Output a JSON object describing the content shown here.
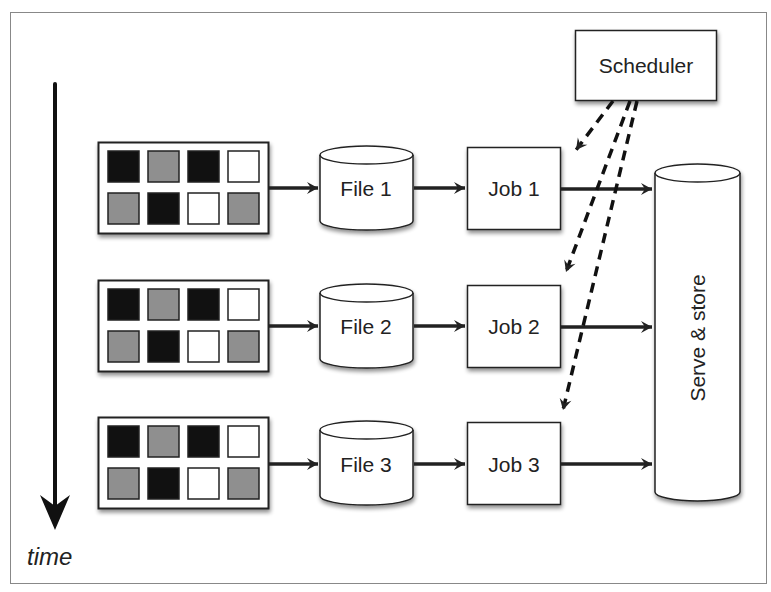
{
  "diagram": {
    "time_label": "time",
    "scheduler_label": "Scheduler",
    "serve_store_label": "Serve & store",
    "rows": [
      {
        "file_label": "File 1",
        "job_label": "Job 1"
      },
      {
        "file_label": "File 2",
        "job_label": "Job 2"
      },
      {
        "file_label": "File 3",
        "job_label": "Job 3"
      }
    ],
    "grid_pattern": [
      [
        "black",
        "gray",
        "black",
        "white"
      ],
      [
        "gray",
        "black",
        "white",
        "gray"
      ]
    ],
    "colors": {
      "black": "#111111",
      "gray": "#8f8f8f",
      "white": "#ffffff",
      "stroke": "#222222",
      "frame": "#888888"
    }
  }
}
